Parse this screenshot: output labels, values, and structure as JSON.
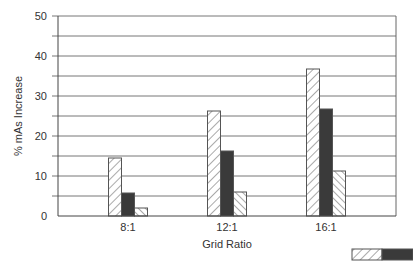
{
  "chart_data": {
    "type": "bar",
    "title": "",
    "xlabel": "Grid Ratio",
    "ylabel": "% mAs Increase",
    "categories": [
      "8:1",
      "12:1",
      "16:1"
    ],
    "series": [
      {
        "name": "Series 1 (wide hatch)",
        "pattern": "hatch-wide",
        "values": [
          14.5,
          26.25,
          36.75
        ]
      },
      {
        "name": "Series 2 (solid dark)",
        "pattern": "solid",
        "color": "#3a3a3a",
        "values": [
          5.75,
          16.25,
          26.75
        ]
      },
      {
        "name": "Series 3 (fine hatch)",
        "pattern": "hatch-fine",
        "values": [
          2,
          6,
          11.25
        ]
      }
    ],
    "ylim": [
      0,
      50
    ],
    "yticks": [
      0,
      10,
      20,
      30,
      40,
      50
    ],
    "gridlines_every": 5,
    "grid": true,
    "legend_position": "bottom-right"
  },
  "labels": {
    "xlabel": "Grid Ratio",
    "ylabel": "% mAs Increase",
    "yticks": [
      "0",
      "10",
      "20",
      "30",
      "40",
      "50"
    ],
    "categories": [
      "8:1",
      "12:1",
      "16:1"
    ]
  }
}
